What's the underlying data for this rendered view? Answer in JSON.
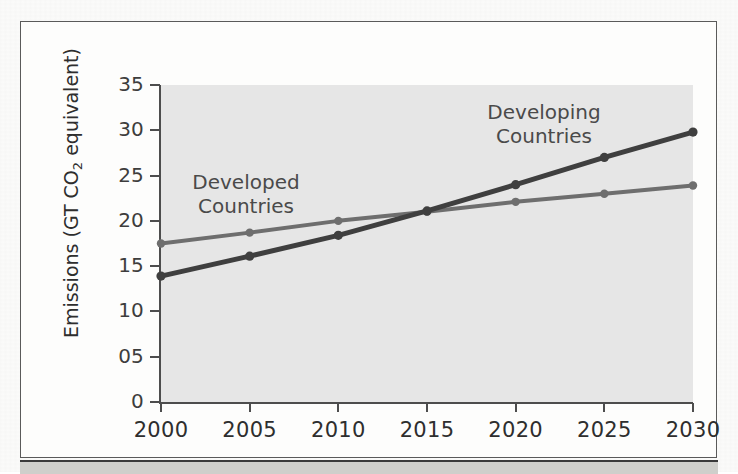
{
  "figure": {
    "background_color": "#e6e6e6",
    "frame_color": "#5a5a5a"
  },
  "chart_data": {
    "type": "line",
    "title": "",
    "xlabel": "",
    "ylabel": "Emissions (GT CO2 equivalent)",
    "ylabel_parts": {
      "before": "Emissions (GT CO",
      "sub": "2",
      "after": " equivalent)"
    },
    "x": [
      2000,
      2005,
      2010,
      2015,
      2020,
      2025,
      2030
    ],
    "categories": [
      "2000",
      "2005",
      "2010",
      "2015",
      "2020",
      "2025",
      "2030"
    ],
    "xlim": [
      2000,
      2030
    ],
    "ylim": [
      0,
      35
    ],
    "ytick_labels": [
      "0",
      "05",
      "10",
      "15",
      "20",
      "25",
      "30",
      "35"
    ],
    "ytick_values": [
      0,
      5,
      10,
      15,
      20,
      25,
      30,
      35
    ],
    "grid": false,
    "legend_position": "inline-annotations",
    "series": [
      {
        "name": "Developed Countries",
        "color": "#6e6e6e",
        "marker": "circle",
        "values": [
          17.5,
          18.7,
          20.0,
          21.0,
          22.1,
          23.0,
          23.9
        ]
      },
      {
        "name": "Developing Countries",
        "color": "#3f3f3f",
        "marker": "circle",
        "values": [
          13.9,
          16.1,
          18.4,
          21.1,
          24.0,
          27.0,
          29.8
        ]
      }
    ],
    "annotations": [
      {
        "text": "Developed\nCountries",
        "series": "Developed Countries"
      },
      {
        "text": "Developing\nCountries",
        "series": "Developing Countries"
      }
    ]
  }
}
